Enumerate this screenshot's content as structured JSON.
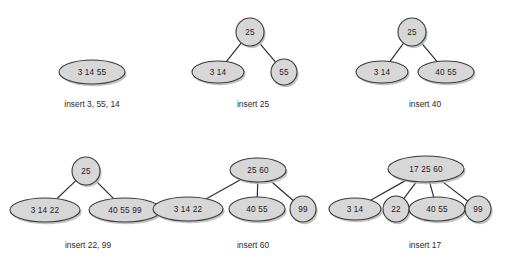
{
  "figure": {
    "type": "b-tree-insertion-sequence",
    "background_color": "#ffffff",
    "node_fill_color": "#d7d7d7",
    "node_stroke_color": "#3a3a3a",
    "edge_color": "#2e2e2e",
    "text_color": "#1a1a1a"
  },
  "panels": [
    {
      "id": "panel-1",
      "caption": "insert 3, 55, 14",
      "caption_x": 92,
      "caption_y": 105,
      "nodes": [
        {
          "id": "p1-root",
          "keys": "3   14   55",
          "x": 92,
          "y": 72,
          "rx": 33,
          "ry": 12
        }
      ],
      "edges": []
    },
    {
      "id": "panel-2",
      "caption": "insert 25",
      "caption_x": 253,
      "caption_y": 105,
      "nodes": [
        {
          "id": "p2-root",
          "keys": "25",
          "x": 250,
          "y": 32,
          "rx": 14,
          "ry": 14
        },
        {
          "id": "p2-left",
          "keys": "3   14",
          "x": 218,
          "y": 72,
          "rx": 26,
          "ry": 11
        },
        {
          "id": "p2-right",
          "keys": "55",
          "x": 284,
          "y": 72,
          "rx": 13,
          "ry": 13
        }
      ],
      "edges": [
        {
          "from": "p2-root",
          "to": "p2-left"
        },
        {
          "from": "p2-root",
          "to": "p2-right"
        }
      ]
    },
    {
      "id": "panel-3",
      "caption": "insert 40",
      "caption_x": 425,
      "caption_y": 105,
      "nodes": [
        {
          "id": "p3-root",
          "keys": "25",
          "x": 412,
          "y": 32,
          "rx": 14,
          "ry": 14
        },
        {
          "id": "p3-left",
          "keys": "3   14",
          "x": 382,
          "y": 72,
          "rx": 26,
          "ry": 11
        },
        {
          "id": "p3-right",
          "keys": "40   55",
          "x": 446,
          "y": 72,
          "rx": 28,
          "ry": 11
        }
      ],
      "edges": [
        {
          "from": "p3-root",
          "to": "p3-left"
        },
        {
          "from": "p3-root",
          "to": "p3-right"
        }
      ]
    },
    {
      "id": "panel-4",
      "caption": "insert 22, 99",
      "caption_x": 88,
      "caption_y": 246,
      "nodes": [
        {
          "id": "p4-root",
          "keys": "25",
          "x": 86,
          "y": 171,
          "rx": 14,
          "ry": 14
        },
        {
          "id": "p4-left",
          "keys": "3   14   22",
          "x": 45,
          "y": 210,
          "rx": 35,
          "ry": 12
        },
        {
          "id": "p4-right",
          "keys": "40   55   99",
          "x": 125,
          "y": 210,
          "rx": 36,
          "ry": 12
        }
      ],
      "edges": [
        {
          "from": "p4-root",
          "to": "p4-left"
        },
        {
          "from": "p4-root",
          "to": "p4-right"
        }
      ]
    },
    {
      "id": "panel-5",
      "caption": "insert 60",
      "caption_x": 253,
      "caption_y": 246,
      "nodes": [
        {
          "id": "p5-root",
          "keys": "25   60",
          "x": 258,
          "y": 170,
          "rx": 28,
          "ry": 12
        },
        {
          "id": "p5-c1",
          "keys": "3   14   22",
          "x": 188,
          "y": 209,
          "rx": 35,
          "ry": 12
        },
        {
          "id": "p5-c2",
          "keys": "40   55",
          "x": 257,
          "y": 209,
          "rx": 28,
          "ry": 12
        },
        {
          "id": "p5-c3",
          "keys": "99",
          "x": 303,
          "y": 209,
          "rx": 13,
          "ry": 13
        }
      ],
      "edges": [
        {
          "from": "p5-root",
          "to": "p5-c1"
        },
        {
          "from": "p5-root",
          "to": "p5-c2"
        },
        {
          "from": "p5-root",
          "to": "p5-c3"
        }
      ]
    },
    {
      "id": "panel-6",
      "caption": "insert 17",
      "caption_x": 425,
      "caption_y": 246,
      "nodes": [
        {
          "id": "p6-root",
          "keys": "17   25   60",
          "x": 426,
          "y": 169,
          "rx": 38,
          "ry": 13
        },
        {
          "id": "p6-c1",
          "keys": "3   14",
          "x": 355,
          "y": 209,
          "rx": 26,
          "ry": 11
        },
        {
          "id": "p6-c2",
          "keys": "22",
          "x": 396,
          "y": 209,
          "rx": 13,
          "ry": 13
        },
        {
          "id": "p6-c3",
          "keys": "40   55",
          "x": 437,
          "y": 209,
          "rx": 28,
          "ry": 12
        },
        {
          "id": "p6-c4",
          "keys": "99",
          "x": 478,
          "y": 209,
          "rx": 13,
          "ry": 13
        }
      ],
      "edges": [
        {
          "from": "p6-root",
          "to": "p6-c1"
        },
        {
          "from": "p6-root",
          "to": "p6-c2"
        },
        {
          "from": "p6-root",
          "to": "p6-c3"
        },
        {
          "from": "p6-root",
          "to": "p6-c4"
        }
      ]
    }
  ]
}
